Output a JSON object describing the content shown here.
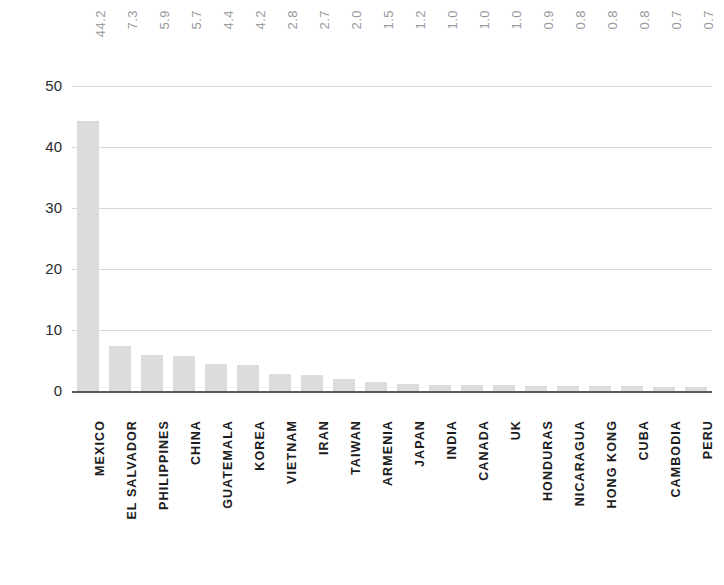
{
  "chart_data": [
    {
      "type": "bar",
      "title": "",
      "subtitle": "",
      "xlabel": "",
      "ylabel": "",
      "ylim": [
        0,
        50
      ],
      "yticks": [
        0,
        10,
        20,
        30,
        40,
        50
      ],
      "ytick_labels": [
        "0",
        "10",
        "20",
        "30",
        "40",
        "50"
      ],
      "grid": true,
      "grid_axis": "y",
      "legend": false,
      "value_labels_position": "above-plot-rotated",
      "bar_color": "#dcdcdc",
      "value_label_color": "#9a9a9a",
      "category_label_color": "#1c1c1c",
      "categories": [
        "MEXICO",
        "EL SALVADOR",
        "PHILIPPINES",
        "CHINA",
        "GUATEMALA",
        "KOREA",
        "VIETNAM",
        "IRAN",
        "TAIWAN",
        "ARMENIA",
        "JAPAN",
        "INDIA",
        "CANADA",
        "UK",
        "HONDURAS",
        "NICARAGUA",
        "HONG KONG",
        "CUBA",
        "CAMBODIA",
        "PERU"
      ],
      "values": [
        44.2,
        7.3,
        5.9,
        5.7,
        4.4,
        4.2,
        2.8,
        2.7,
        2.0,
        1.5,
        1.2,
        1.0,
        1.0,
        1.0,
        0.9,
        0.8,
        0.8,
        0.8,
        0.7,
        0.7
      ],
      "value_labels": [
        "44.2",
        "7.3",
        "5.9",
        "5.7",
        "4.4",
        "4.2",
        "2.8",
        "2.7",
        "2.0",
        "1.5",
        "1.2",
        "1.0",
        "1.0",
        "1.0",
        "0.9",
        "0.8",
        "0.8",
        "0.8",
        "0.7",
        "0.7"
      ]
    },
    {
      "type": "bar",
      "title": "",
      "note": "partially visible chart cropped at bottom of screenshot",
      "ytick_labels": [
        "140000"
      ],
      "yticks": [
        140000
      ],
      "grid": true,
      "categories": [],
      "values": []
    }
  ]
}
